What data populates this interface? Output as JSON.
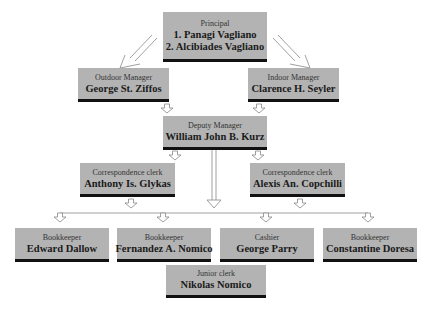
{
  "chart": {
    "nodes": [
      {
        "id": "principal",
        "role": "Principal",
        "names": [
          "1. Panagi Vagliano",
          "2. Alcibiades Vagliano"
        ]
      },
      {
        "id": "outdoor",
        "role": "Outdoor Manager",
        "names": [
          "George St. Ziffos"
        ]
      },
      {
        "id": "indoor",
        "role": "Indoor Manager",
        "names": [
          "Clarence H. Seyler"
        ]
      },
      {
        "id": "deputy",
        "role": "Deputy Manager",
        "names": [
          "William John B. Kurz"
        ]
      },
      {
        "id": "corr1",
        "role": "Correspondence clerk",
        "names": [
          "Anthony Is. Glykas"
        ]
      },
      {
        "id": "corr2",
        "role": "Correspondence clerk",
        "names": [
          "Alexis An. Copchilli"
        ]
      },
      {
        "id": "book1",
        "role": "Bookkeeper",
        "names": [
          "Edward Dallow"
        ]
      },
      {
        "id": "book2",
        "role": "Bookkeeper",
        "names": [
          "Fernandez A. Nomico"
        ]
      },
      {
        "id": "cashier",
        "role": "Cashier",
        "names": [
          "George Parry"
        ]
      },
      {
        "id": "book3",
        "role": "Bookkeeper",
        "names": [
          "Constantine Doresa"
        ]
      },
      {
        "id": "junior",
        "role": "Junior clerk",
        "names": [
          "Nikolas Nomico"
        ]
      }
    ],
    "edges": [
      [
        "principal",
        "outdoor"
      ],
      [
        "principal",
        "indoor"
      ],
      [
        "outdoor",
        "deputy"
      ],
      [
        "indoor",
        "deputy"
      ],
      [
        "deputy",
        "corr1"
      ],
      [
        "deputy",
        "corr2"
      ],
      [
        "deputy",
        "bottom-row"
      ],
      [
        "corr1",
        "bottom-row"
      ],
      [
        "corr2",
        "bottom-row"
      ],
      [
        "bottom-row",
        "book1"
      ],
      [
        "bottom-row",
        "book2"
      ],
      [
        "bottom-row",
        "cashier"
      ],
      [
        "bottom-row",
        "book3"
      ]
    ],
    "colors": {
      "box": "#b3b3b3",
      "bar": "#111111",
      "arrow": "#888888"
    }
  }
}
